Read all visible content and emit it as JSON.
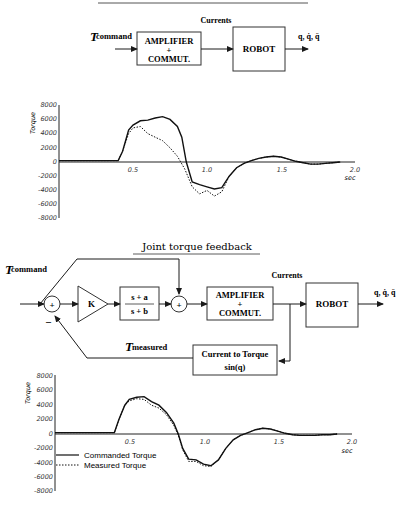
{
  "top_diagram": {
    "input_label": "T",
    "input_subscript": "command",
    "amplifier_line1": "AMPLIFIER",
    "amplifier_line2": "+",
    "amplifier_line3": "COMMUT.",
    "currents_label": "Currents",
    "robot_label": "ROBOT",
    "output_label": "q, q̇, q̈"
  },
  "bottom_diagram": {
    "title": "Joint torque feedback",
    "input_label": "T",
    "input_subscript": "command",
    "sum1_sign": "+",
    "sum1_minus": "–",
    "gain_label": "K",
    "filter_num": "s + a",
    "filter_den": "s + b",
    "sum2_sign": "+",
    "amplifier_line1": "AMPLIFIER",
    "amplifier_line2": "+",
    "amplifier_line3": "COMMUT.",
    "currents_label": "Currents",
    "robot_label": "ROBOT",
    "output_label": "q, q̇, q̈",
    "feedback_label": "T",
    "feedback_subscript": "measured",
    "converter_line1": "Current to Torque",
    "converter_line2": "sin(q)"
  },
  "chart_data": [
    {
      "type": "line",
      "title": "Torque response without joint torque feedback",
      "xlabel": "sec",
      "ylabel": "Torque",
      "xlim": [
        0,
        2.0
      ],
      "ylim": [
        -8000,
        8000
      ],
      "x_ticks": [
        "0.5",
        "1.0",
        "1.5",
        "2.0"
      ],
      "y_ticks": [
        "8000",
        "6000",
        "4000",
        "2000",
        "0",
        "-2000",
        "-4000",
        "-6000",
        "-8000"
      ],
      "grid": false,
      "series": [
        {
          "name": "Commanded Torque",
          "style": "solid",
          "x": [
            0,
            0.4,
            0.43,
            0.47,
            0.5,
            0.55,
            0.6,
            0.65,
            0.7,
            0.75,
            0.8,
            0.83,
            0.86,
            0.9,
            0.95,
            1.0,
            1.05,
            1.1,
            1.15,
            1.2,
            1.25,
            1.3,
            1.35,
            1.4,
            1.45,
            1.5,
            1.55,
            1.6,
            1.65,
            1.7,
            1.75,
            1.8,
            1.85,
            1.9
          ],
          "y": [
            200,
            200,
            1500,
            4500,
            5200,
            5800,
            5900,
            6200,
            6400,
            6000,
            5000,
            3500,
            0,
            -2800,
            -3200,
            -3500,
            -3800,
            -3600,
            -2000,
            -800,
            -200,
            200,
            500,
            700,
            800,
            700,
            400,
            100,
            -100,
            -300,
            -300,
            -200,
            -100,
            0
          ]
        },
        {
          "name": "Measured Torque",
          "style": "dotted",
          "x": [
            0,
            0.4,
            0.43,
            0.47,
            0.5,
            0.55,
            0.6,
            0.65,
            0.7,
            0.75,
            0.8,
            0.85,
            0.9,
            0.95,
            1.0,
            1.05,
            1.1,
            1.15,
            1.2,
            1.25,
            1.3,
            1.35,
            1.4,
            1.45,
            1.5,
            1.55,
            1.6,
            1.65,
            1.7,
            1.75,
            1.8,
            1.85,
            1.9
          ],
          "y": [
            200,
            200,
            1500,
            4000,
            4800,
            5000,
            4000,
            3500,
            3000,
            2000,
            800,
            -1000,
            -3500,
            -4500,
            -4000,
            -4800,
            -4200,
            -2000,
            -800,
            -200,
            200,
            500,
            700,
            800,
            700,
            400,
            100,
            -100,
            -300,
            -300,
            -200,
            -100,
            0
          ]
        }
      ]
    },
    {
      "type": "line",
      "title": "Torque response with joint torque feedback",
      "xlabel": "sec",
      "ylabel": "Torque",
      "xlim": [
        0,
        2.0
      ],
      "ylim": [
        -8000,
        8000
      ],
      "x_ticks": [
        "0.5",
        "1.0",
        "1.5",
        "2.0"
      ],
      "y_ticks": [
        "8000",
        "6000",
        "4000",
        "2000",
        "0",
        "-2000",
        "-4000",
        "-6000",
        "-8000"
      ],
      "grid": false,
      "legend": [
        "Commanded Torque",
        "Measured Torque"
      ],
      "legend_position": "lower left",
      "series": [
        {
          "name": "Commanded Torque",
          "style": "solid",
          "x": [
            0,
            0.4,
            0.43,
            0.47,
            0.5,
            0.55,
            0.6,
            0.65,
            0.7,
            0.75,
            0.8,
            0.83,
            0.86,
            0.9,
            0.95,
            1.0,
            1.05,
            1.1,
            1.15,
            1.2,
            1.25,
            1.3,
            1.35,
            1.4,
            1.45,
            1.5,
            1.55,
            1.6,
            1.65,
            1.7,
            1.75,
            1.8,
            1.85,
            1.9
          ],
          "y": [
            200,
            200,
            2000,
            4000,
            4800,
            5100,
            5200,
            4500,
            4000,
            3000,
            1500,
            0,
            -2000,
            -3500,
            -3600,
            -4200,
            -4400,
            -3600,
            -2000,
            -800,
            -200,
            200,
            600,
            800,
            700,
            400,
            100,
            -100,
            -200,
            -200,
            -200,
            -100,
            -100,
            0
          ]
        },
        {
          "name": "Measured Torque",
          "style": "dotted",
          "x": [
            0,
            0.4,
            0.43,
            0.47,
            0.5,
            0.55,
            0.6,
            0.65,
            0.7,
            0.75,
            0.8,
            0.83,
            0.86,
            0.9,
            0.95,
            1.0,
            1.05,
            1.1,
            1.15,
            1.2,
            1.25,
            1.3,
            1.35,
            1.4,
            1.45,
            1.5,
            1.55,
            1.6,
            1.65,
            1.7,
            1.75,
            1.8,
            1.85,
            1.9
          ],
          "y": [
            200,
            200,
            2000,
            4000,
            4600,
            4900,
            4800,
            4000,
            3600,
            2700,
            1200,
            -200,
            -2200,
            -3800,
            -3800,
            -4400,
            -4500,
            -3600,
            -2000,
            -800,
            -200,
            200,
            600,
            800,
            700,
            400,
            100,
            -100,
            -200,
            -200,
            -200,
            -100,
            -100,
            0
          ]
        }
      ]
    }
  ]
}
